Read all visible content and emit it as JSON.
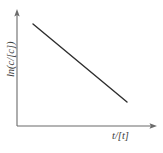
{
  "figure": {
    "title": "",
    "background_color": "#ffffff",
    "axis_color": "#6b6b6b",
    "line_color": "#2e2e2e"
  },
  "axes": {
    "y": {
      "label": "ln(c/[c])",
      "arrow": "arrow-up",
      "x_px": 17,
      "top_px": 10,
      "bottom_px": 126
    },
    "x": {
      "label": "t/[t]",
      "arrow": "arrow-right",
      "y_px": 126,
      "left_px": 17,
      "right_px": 157
    }
  },
  "chart_data": {
    "type": "line",
    "title": "",
    "xlabel": "t/[t]",
    "ylabel": "ln(c/[c])",
    "grid": false,
    "legend": null,
    "axis_ticks": {
      "x": [],
      "y": []
    },
    "xlim": [
      0,
      1
    ],
    "ylim": [
      0,
      1
    ],
    "series": [
      {
        "name": "ln(c/[c]) vs t/[t]",
        "style": "straight-decreasing",
        "x": [
          0.114,
          0.786
        ],
        "y": [
          0.879,
          0.207
        ],
        "points_px": [
          {
            "x": 33,
            "y": 24
          },
          {
            "x": 127,
            "y": 102
          }
        ]
      }
    ]
  }
}
